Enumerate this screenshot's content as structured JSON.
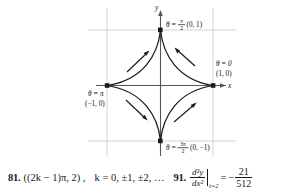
{
  "figure": {
    "axis_labels": {
      "x": "x",
      "y": "y"
    },
    "curve_name": "astroid",
    "points": [
      {
        "id": "theta-pi-over-2",
        "theta_prefix": "θ =",
        "theta_num": "π",
        "theta_den": "2",
        "coords": "(0, 1)",
        "combined": "θ = π/2 (0, 1)"
      },
      {
        "id": "theta-zero",
        "theta_prefix": "θ = 0",
        "coords": "(1, 0)",
        "combined": "θ = 0 (1, 0)"
      },
      {
        "id": "theta-pi",
        "theta_prefix": "θ = π",
        "coords": "(−1, 0)",
        "combined": "θ = π (−1, 0)"
      },
      {
        "id": "theta-3pi-over-2",
        "theta_prefix": "θ =",
        "theta_num": "3π",
        "theta_den": "2",
        "coords": "(0, −1)",
        "combined": "θ = 3π/2 (0, −1)"
      }
    ],
    "colors": {
      "curve": "#1a1a1a",
      "axis": "#4d4d4d",
      "grid": "#c8c8c8",
      "point": "#1a1a1a"
    }
  },
  "answers": [
    {
      "number": "81.",
      "expression": "((2k − 1)π, 2) ,",
      "condition": "k = 0, ±1, ±2, …"
    },
    {
      "number": "91.",
      "derivative_num": "d²y",
      "derivative_den": "dx²",
      "evaluated_at": "t=2",
      "equals": "=",
      "sign": "−",
      "value_num": "21",
      "value_den": "512",
      "full": "d²y/dx² |t=2 = −21/512"
    }
  ]
}
